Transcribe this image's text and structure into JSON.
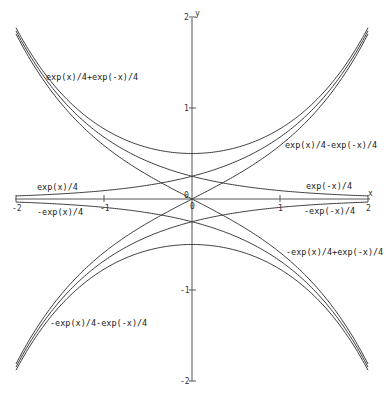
{
  "chart_data": {
    "type": "line",
    "title": "",
    "xlabel": "x",
    "ylabel": "y",
    "xlim": [
      -2,
      2
    ],
    "ylim": [
      -2,
      2
    ],
    "grid": false,
    "legend_position": "inline labels",
    "x_ticks": [
      -2,
      -1,
      0,
      1,
      2
    ],
    "y_ticks": [
      -2,
      -1,
      1,
      2
    ],
    "x_tick_labels": [
      "-2",
      "-1",
      "0",
      "1",
      "2"
    ],
    "y_tick_labels": [
      "-2",
      "-1",
      "1",
      "2"
    ],
    "origin_label": "0",
    "series": [
      {
        "name": "exp(x)/4",
        "a": 0.25,
        "b": 0,
        "label_x": 37,
        "label_y": 190
      },
      {
        "name": "-exp(x)/4",
        "a": -0.25,
        "b": 0,
        "label_x": 37,
        "label_y": 215
      },
      {
        "name": "exp(-x)/4",
        "a": 0,
        "b": 0.25,
        "label_x": 306,
        "label_y": 189
      },
      {
        "name": "-exp(-x)/4",
        "a": 0,
        "b": -0.25,
        "label_x": 304,
        "label_y": 214
      },
      {
        "name": "exp(x)/4+exp(-x)/4",
        "a": 0.25,
        "b": 0.25,
        "label_x": 46,
        "label_y": 80
      },
      {
        "name": "exp(x)/4-exp(-x)/4",
        "a": 0.25,
        "b": -0.25,
        "label_x": 285,
        "label_y": 148
      },
      {
        "name": "-exp(x)/4+exp(-x)/4",
        "a": -0.25,
        "b": 0.25,
        "label_x": 286,
        "label_y": 255
      },
      {
        "name": "-exp(x)/4-exp(-x)/4",
        "a": -0.25,
        "b": -0.25,
        "label_x": 50,
        "label_y": 326
      }
    ],
    "values_sampled": {
      "x": [
        -2,
        -1,
        0,
        1,
        2
      ],
      "exp(x)/4": [
        0.034,
        0.092,
        0.25,
        0.68,
        1.847
      ],
      "-exp(x)/4": [
        -0.034,
        -0.092,
        -0.25,
        -0.68,
        -1.847
      ],
      "exp(-x)/4": [
        1.847,
        0.68,
        0.25,
        0.092,
        0.034
      ],
      "-exp(-x)/4": [
        -1.847,
        -0.68,
        -0.25,
        -0.092,
        -0.034
      ],
      "exp(x)/4+exp(-x)/4": [
        1.881,
        0.771,
        0.5,
        0.771,
        1.881
      ],
      "exp(x)/4-exp(-x)/4": [
        -1.813,
        -0.588,
        0,
        0.588,
        1.813
      ],
      "-exp(x)/4+exp(-x)/4": [
        1.813,
        0.588,
        0,
        -0.588,
        -1.813
      ],
      "-exp(x)/4-exp(-x)/4": [
        -1.881,
        -0.771,
        -0.5,
        -0.771,
        -1.881
      ]
    }
  },
  "axes": {
    "x_axis_label": "x",
    "y_axis_label": "y"
  }
}
